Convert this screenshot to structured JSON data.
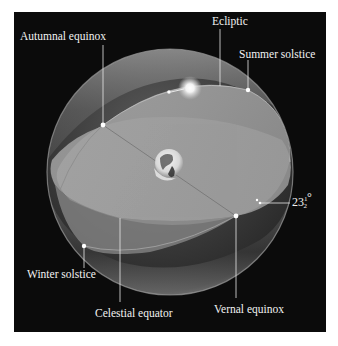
{
  "figure": {
    "colors": {
      "background": "#0b0b0b",
      "border": "#ffffff",
      "sphere_light": "#bdbdbd",
      "sphere_dark": "#262626",
      "equator_plane": "#9a9a9a",
      "label": "#f2f2f2"
    },
    "labels": {
      "ecliptic": "Ecliptic",
      "autumnal_equinox": "Autumnal equinox",
      "summer_solstice": "Summer solstice",
      "winter_solstice": "Winter solstice",
      "celestial_equator": "Celestial equator",
      "vernal_equinox": "Vernal equinox",
      "tilt_angle": "23½°"
    },
    "tilt": {
      "whole": "23",
      "fraction_num": "1",
      "fraction_den": "2",
      "unit": "°"
    },
    "objects": {
      "sun": "Sun",
      "earth": "Earth"
    }
  }
}
